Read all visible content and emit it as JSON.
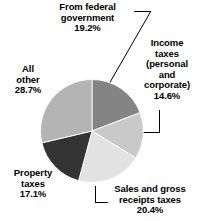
{
  "chart_data": {
    "type": "pie",
    "title": "",
    "subtitle": "",
    "xlabel": "",
    "ylabel": "",
    "legend_position": "none",
    "grid": false,
    "units": "percent",
    "start_angle_deg": 0,
    "direction": "clockwise",
    "categories": [
      "From federal government",
      "Income taxes (personal and corporate)",
      "Sales and gross receipts taxes",
      "Property taxes",
      "All other"
    ],
    "values": [
      19.2,
      14.6,
      20.4,
      17.1,
      28.7
    ],
    "slices": [
      {
        "name": "From federal government",
        "value": 19.2,
        "value_text": "19.2%",
        "color": "#848484",
        "label_lines": [
          "From federal",
          "government"
        ],
        "label_position": "top"
      },
      {
        "name": "Income taxes (personal and corporate)",
        "value": 14.6,
        "value_text": "14.6%",
        "color": "#c9c9c9",
        "label_lines": [
          "Income",
          "taxes",
          "(personal",
          "and",
          "corporate)"
        ],
        "label_position": "right"
      },
      {
        "name": "Sales and gross receipts taxes",
        "value": 20.4,
        "value_text": "20.4%",
        "color": "#e2e2e2",
        "label_lines": [
          "Sales and gross",
          "receipts taxes"
        ],
        "label_position": "bottom-right"
      },
      {
        "name": "Property taxes",
        "value": 17.1,
        "value_text": "17.1%",
        "color": "#333333",
        "label_lines": [
          "Property",
          "taxes"
        ],
        "label_position": "bottom-left"
      },
      {
        "name": "All other",
        "value": 28.7,
        "value_text": "28.7%",
        "color": "#b4b4b4",
        "label_lines": [
          "All",
          "other"
        ],
        "label_position": "left"
      }
    ]
  },
  "labels": {
    "federal": {
      "line1": "From federal",
      "line2": "government",
      "pct": "19.2%"
    },
    "income": {
      "line1": "Income",
      "line2": "taxes",
      "line3": "(personal",
      "line4": "and",
      "line5": "corporate)",
      "pct": "14.6%"
    },
    "allother": {
      "line1": "All",
      "line2": "other",
      "pct": "28.7%"
    },
    "property": {
      "line1": "Property",
      "line2": "taxes",
      "pct": "17.1%"
    },
    "sales": {
      "line1": "Sales and gross",
      "line2": "receipts taxes",
      "pct": "20.4%"
    }
  },
  "colors": {
    "background": "#ffffff",
    "text": "#000000",
    "leader_line": "#000000",
    "slice_federal": "#848484",
    "slice_income": "#c9c9c9",
    "slice_sales": "#e2e2e2",
    "slice_property": "#333333",
    "slice_allother": "#b4b4b4"
  }
}
